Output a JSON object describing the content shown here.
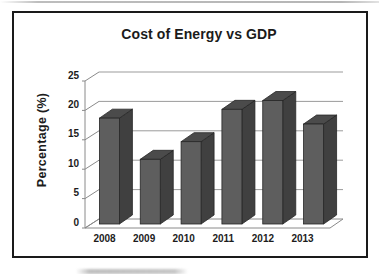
{
  "frame": {
    "border_color": "#1a1a1a",
    "background": "#ffffff",
    "top_edge_artifact_color": "#b9b9b9"
  },
  "chart_data": {
    "type": "bar",
    "variant": "3d-column",
    "title": "Cost of Energy vs GDP",
    "categories": [
      "2008",
      "2009",
      "2010",
      "2011",
      "2012",
      "2013"
    ],
    "values": [
      18,
      11,
      14,
      19.5,
      21,
      17
    ],
    "xlabel": "",
    "ylabel": "Percentage (%)",
    "ylim": [
      0,
      25
    ],
    "yticks": [
      0,
      5,
      10,
      15,
      20,
      25
    ],
    "grid": true,
    "legend": false,
    "colors": {
      "bar_front": "#5e5e5e",
      "bar_top": "#4b4b4b",
      "bar_side": "#404040",
      "bar_outline": "#262626",
      "gridline": "#9b9b9b",
      "axis": "#8a8a8a",
      "text": "#1c1c1c"
    }
  }
}
